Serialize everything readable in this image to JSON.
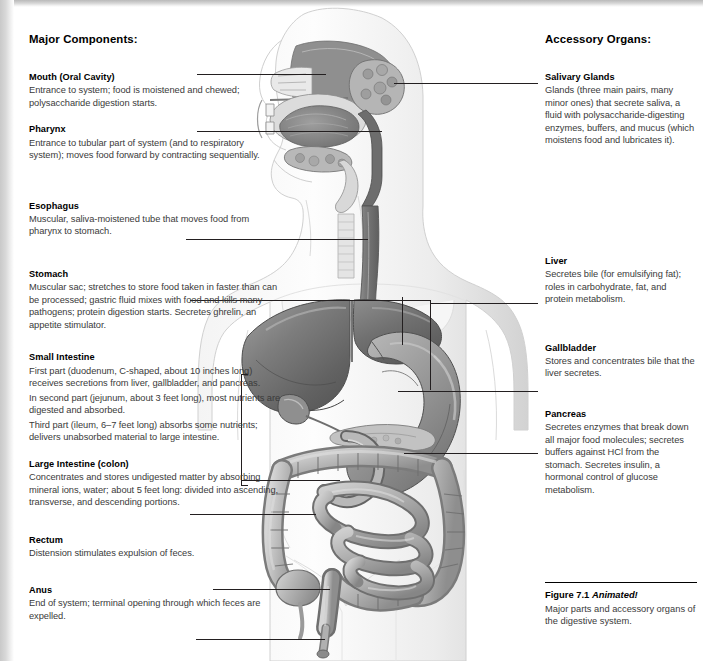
{
  "figure": {
    "title_bold": "Figure 7.1",
    "title_italic": "Animated!",
    "caption": "Major parts and accessory organs of the digestive system."
  },
  "left_column": {
    "heading": "Major Components:",
    "items": [
      {
        "name": "mouth",
        "title": "Mouth (Oral Cavity)",
        "paragraphs": [
          "Entrance to system; food is moistened and chewed; polysaccharide digestion starts."
        ]
      },
      {
        "name": "pharynx",
        "title": "Pharynx",
        "paragraphs": [
          "Entrance to tubular part of system (and to respiratory system); moves food forward by contracting sequentially."
        ]
      },
      {
        "name": "esophagus",
        "title": "Esophagus",
        "paragraphs": [
          "Muscular, saliva-moistened tube that moves food from pharynx to stomach."
        ]
      },
      {
        "name": "stomach",
        "title": "Stomach",
        "paragraphs": [
          "Muscular sac; stretches to store food taken in faster than can be processed; gastric fluid mixes with food and kills many pathogens; protein digestion starts. Secretes ghrelin, an appetite stimulator."
        ]
      },
      {
        "name": "small-intestine",
        "title": "Small Intestine",
        "paragraphs": [
          "First part (duodenum, C-shaped, about 10 inches long) receives secretions from liver, gallbladder, and pancreas.",
          "In second part (jejunum, about 3 feet long), most nutrients are digested and absorbed.",
          "Third part (ileum, 6–7 feet long) absorbs some nutrients; delivers unabsorbed material to large intestine."
        ]
      },
      {
        "name": "large-intestine",
        "title": "Large Intestine (colon)",
        "paragraphs": [
          "Concentrates and stores undigested matter by absorbing mineral ions, water; about 5 feet long: divided into ascending, transverse, and descending portions."
        ]
      },
      {
        "name": "rectum",
        "title": "Rectum",
        "paragraphs": [
          "Distension stimulates expulsion of feces."
        ]
      },
      {
        "name": "anus",
        "title": "Anus",
        "paragraphs": [
          "End of system; terminal opening through which feces are expelled."
        ]
      }
    ]
  },
  "right_column": {
    "heading": "Accessory Organs:",
    "items": [
      {
        "name": "salivary-glands",
        "title": "Salivary Glands",
        "paragraphs": [
          "Glands (three main pairs, many minor ones) that secrete saliva, a fluid with polysaccharide-digesting enzymes, buffers, and mucus (which moistens food and lubricates it)."
        ]
      },
      {
        "name": "liver",
        "title": "Liver",
        "paragraphs": [
          "Secretes bile (for emulsifying fat); roles in carbohydrate, fat, and protein metabolism."
        ]
      },
      {
        "name": "gallbladder",
        "title": "Gallbladder",
        "paragraphs": [
          "Stores and concentrates bile that the liver secretes."
        ]
      },
      {
        "name": "pancreas",
        "title": "Pancreas",
        "paragraphs": [
          "Secretes enzymes that break down all major food molecules; secretes buffers against HCl from the stomach. Secretes insulin, a hormonal control of glucose metabolism."
        ]
      }
    ]
  },
  "illustration": {
    "description": "Grayscale anatomical drawing of the human digestive system shown in a standing body outline: sagittal head section with nasal cavity, tongue, salivary glands and pharynx; esophagus descending through the chest; liver, stomach, gallbladder, pancreas, duodenum, coiled small intestine, framing large intestine, rectum and anus.",
    "labeled_parts": [
      "mouth",
      "pharynx",
      "salivary glands",
      "esophagus",
      "liver",
      "stomach",
      "gallbladder",
      "pancreas",
      "small intestine",
      "large intestine",
      "rectum",
      "anus"
    ]
  },
  "colors": {
    "page_background": "#ffffff",
    "heading_text": "#000000",
    "body_text": "#3a3a3a",
    "leader_line": "#231f20",
    "organ_dark": "#6e6e6e",
    "organ_mid": "#9a9a9a",
    "organ_light": "#c9c9c9",
    "body_outline": "#d7d7d7"
  }
}
